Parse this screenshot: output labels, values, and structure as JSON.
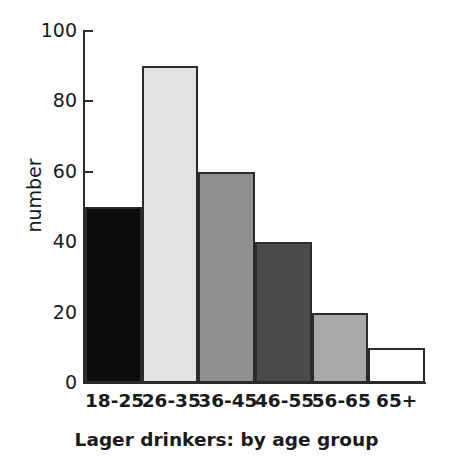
{
  "chart_data": {
    "type": "bar",
    "title": "Lager drinkers: by age group",
    "title_position": "below-axis",
    "xlabel": "",
    "ylabel": "number",
    "categories": [
      "18-25",
      "26-35",
      "36-45",
      "46-55",
      "56-65",
      "65+"
    ],
    "values": [
      50,
      90,
      60,
      40,
      20,
      10
    ],
    "series": [
      {
        "name": "number",
        "values": [
          50,
          90,
          60,
          40,
          20,
          10
        ]
      }
    ],
    "ylim": [
      0,
      100
    ],
    "y_ticks": [
      0,
      20,
      40,
      60,
      80,
      100
    ],
    "y_tick_labels": [
      "0",
      "20",
      "40",
      "60",
      "80",
      "100"
    ],
    "grid": false,
    "legend": false,
    "bar_gap": 0,
    "bar_colors": [
      "#0d0d0d",
      "#e2e2e2",
      "#8f8f8f",
      "#4a4a4a",
      "#a8a8a8",
      "#ffffff"
    ],
    "bar_edge_color": "#2b2b2b",
    "axis_color": "#2b2b2b",
    "background": "#ffffff",
    "bars": [
      {
        "category": "18-25",
        "value": 50,
        "color": "#0d0d0d"
      },
      {
        "category": "26-35",
        "value": 90,
        "color": "#e2e2e2"
      },
      {
        "category": "36-45",
        "value": 60,
        "color": "#8f8f8f"
      },
      {
        "category": "46-55",
        "value": 40,
        "color": "#4a4a4a"
      },
      {
        "category": "56-65",
        "value": 20,
        "color": "#a8a8a8"
      },
      {
        "category": "65+",
        "value": 10,
        "color": "#ffffff"
      }
    ]
  }
}
